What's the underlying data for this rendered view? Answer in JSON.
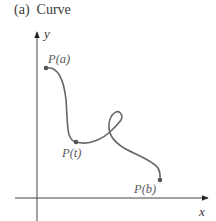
{
  "figure": {
    "caption": "(a)  Curve",
    "axes": {
      "x_label": "x",
      "y_label": "y"
    },
    "points": [
      {
        "id": "start",
        "label": "P(a)"
      },
      {
        "id": "middle",
        "label": "P(t)"
      },
      {
        "id": "end",
        "label": "P(b)"
      }
    ],
    "colors": {
      "curve": "#666666",
      "axes": "#333333",
      "labels": "#5a5a5a"
    }
  }
}
